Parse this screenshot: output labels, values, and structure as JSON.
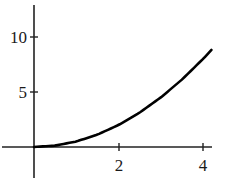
{
  "chart_data": {
    "type": "line",
    "title": "",
    "xlabel": "",
    "ylabel": "",
    "xlim": [
      -0.75,
      4.2
    ],
    "ylim": [
      -2.8,
      12.8
    ],
    "grid": false,
    "legend": null,
    "x_ticks": [
      2,
      4
    ],
    "x_tick_labels": [
      "2",
      "4"
    ],
    "y_ticks": [
      5,
      10
    ],
    "y_tick_labels": [
      "5",
      "10"
    ],
    "series": [
      {
        "name": "f(x)",
        "function_estimate": "y = x^2 / 2",
        "x": [
          0,
          0.5,
          1,
          1.5,
          2,
          2.5,
          3,
          3.5,
          4,
          4.2
        ],
        "values": [
          0,
          0.125,
          0.5,
          1.125,
          2,
          3.125,
          4.5,
          6.125,
          8,
          8.82
        ],
        "color": "#000000"
      }
    ]
  },
  "axes": {
    "x_tick_2": "2",
    "x_tick_4": "4",
    "y_tick_5": "5",
    "y_tick_10": "10"
  },
  "colors": {
    "axis": "#222222",
    "curve": "#000000",
    "background": "#ffffff"
  }
}
